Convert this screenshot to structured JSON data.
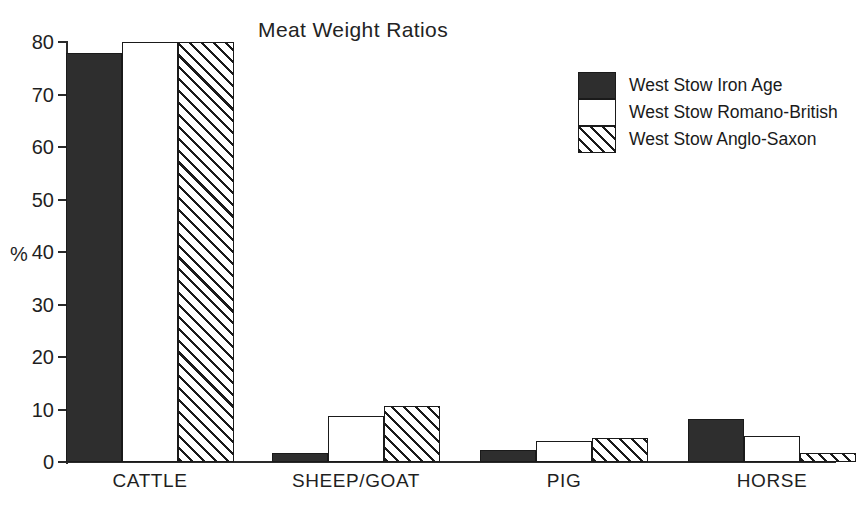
{
  "chart_data": {
    "type": "bar",
    "title": "Meat Weight Ratios",
    "xlabel": "",
    "ylabel": "%",
    "ylim": [
      0,
      80
    ],
    "yticks": [
      0,
      10,
      20,
      30,
      40,
      50,
      60,
      70,
      80
    ],
    "grid": false,
    "legend_position": "top-right",
    "categories": [
      "CATTLE",
      "SHEEP/GOAT",
      "PIG",
      "HORSE"
    ],
    "series": [
      {
        "name": "West Stow Iron Age",
        "fill": "solid",
        "color": "#2e2e2e",
        "values": [
          78.0,
          1.7,
          2.2,
          8.2
        ]
      },
      {
        "name": "West Stow Romano-British",
        "fill": "open",
        "color": "#ffffff",
        "values": [
          80.0,
          8.7,
          4.0,
          4.9
        ]
      },
      {
        "name": "West Stow Anglo-Saxon",
        "fill": "hatch",
        "color": "#ffffff",
        "values": [
          80.0,
          10.7,
          4.5,
          1.8
        ]
      }
    ]
  },
  "axis": {
    "unit_label": "%",
    "tick_labels": [
      "0",
      "10",
      "20",
      "30",
      "40",
      "50",
      "60",
      "70",
      "80"
    ]
  },
  "legend": {
    "entries": [
      {
        "label": "West Stow Iron Age"
      },
      {
        "label": "West Stow Romano-British"
      },
      {
        "label": "West Stow Anglo-Saxon"
      }
    ]
  }
}
